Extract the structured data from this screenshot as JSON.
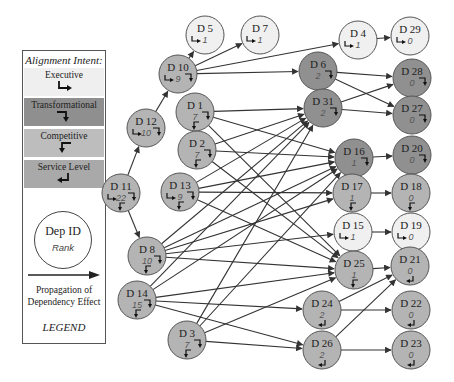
{
  "legend": {
    "title": "Alignment Intent:",
    "intents": [
      {
        "key": "executive",
        "label": "Executive",
        "color": "#efefef",
        "icon": "arrow-down-right-icon"
      },
      {
        "key": "transformational",
        "label": "Transformational",
        "color": "#8f8f8f",
        "icon": "arrow-right-down-icon"
      },
      {
        "key": "competitive",
        "label": "Competitive",
        "color": "#bdbdbd",
        "icon": "arrow-left-down-icon"
      },
      {
        "key": "service",
        "label": "Service Level",
        "color": "#a9a9a9",
        "icon": "arrow-down-left-icon"
      }
    ],
    "node_id_label": "Dep ID",
    "node_rank_label": "Rank",
    "propagation_label_1": "Propagation of",
    "propagation_label_2": "Dependency Effect",
    "footer": "LEGEND"
  },
  "colors": {
    "light": "#f0f0f0",
    "mid": "#b4b4b4",
    "dark": "#909090",
    "edge": "#333333"
  },
  "nodes": [
    {
      "id": "D 5",
      "rank": "1",
      "shade": "light",
      "intents": [
        "executive"
      ]
    },
    {
      "id": "D 7",
      "rank": "1",
      "shade": "light",
      "intents": [
        "executive"
      ]
    },
    {
      "id": "D 10",
      "rank": "9",
      "shade": "mid",
      "intents": [
        "executive",
        "transformational"
      ]
    },
    {
      "id": "D 4",
      "rank": "1",
      "shade": "light",
      "intents": [
        "executive"
      ]
    },
    {
      "id": "D 29",
      "rank": "0",
      "shade": "light",
      "intents": [
        "executive"
      ]
    },
    {
      "id": "D 6",
      "rank": "2",
      "shade": "dark",
      "intents": [
        "transformational"
      ]
    },
    {
      "id": "D 28",
      "rank": "0",
      "shade": "dark",
      "intents": [
        "transformational"
      ]
    },
    {
      "id": "D 1",
      "rank": "7",
      "shade": "mid",
      "intents": [
        "transformational",
        "competitive"
      ]
    },
    {
      "id": "D 31",
      "rank": "2",
      "shade": "dark",
      "intents": [
        "transformational"
      ]
    },
    {
      "id": "D 27",
      "rank": "0",
      "shade": "dark",
      "intents": [
        "transformational"
      ]
    },
    {
      "id": "D 12",
      "rank": "10",
      "shade": "mid",
      "intents": [
        "executive",
        "transformational"
      ]
    },
    {
      "id": "D 2",
      "rank": "7",
      "shade": "mid",
      "intents": [
        "transformational",
        "competitive"
      ]
    },
    {
      "id": "D 16",
      "rank": "1",
      "shade": "dark",
      "intents": [
        "transformational"
      ]
    },
    {
      "id": "D 20",
      "rank": "0",
      "shade": "dark",
      "intents": [
        "transformational"
      ]
    },
    {
      "id": "D 13",
      "rank": "9",
      "shade": "mid",
      "intents": [
        "executive",
        "transformational",
        "competitive"
      ]
    },
    {
      "id": "D 17",
      "rank": "1",
      "shade": "mid",
      "intents": [
        "competitive"
      ]
    },
    {
      "id": "D 18",
      "rank": "0",
      "shade": "mid",
      "intents": [
        "competitive"
      ]
    },
    {
      "id": "D 11",
      "rank": "22",
      "shade": "mid",
      "intents": [
        "executive",
        "transformational",
        "competitive"
      ]
    },
    {
      "id": "D 15",
      "rank": "1",
      "shade": "light",
      "intents": [
        "executive"
      ]
    },
    {
      "id": "D 19",
      "rank": "0",
      "shade": "light",
      "intents": [
        "executive"
      ]
    },
    {
      "id": "D 8",
      "rank": "10",
      "shade": "mid",
      "intents": [
        "transformational",
        "competitive"
      ]
    },
    {
      "id": "D 25",
      "rank": "1",
      "shade": "mid",
      "intents": [
        "competitive"
      ]
    },
    {
      "id": "D 21",
      "rank": "0",
      "shade": "mid",
      "intents": [
        "service"
      ]
    },
    {
      "id": "D 14",
      "rank": "15",
      "shade": "mid",
      "intents": [
        "transformational",
        "competitive"
      ]
    },
    {
      "id": "D 24",
      "rank": "2",
      "shade": "mid",
      "intents": [
        "service"
      ]
    },
    {
      "id": "D 22",
      "rank": "0",
      "shade": "mid",
      "intents": [
        "service"
      ]
    },
    {
      "id": "D 3",
      "rank": "7",
      "shade": "mid",
      "intents": [
        "transformational",
        "competitive"
      ]
    },
    {
      "id": "D 26",
      "rank": "2",
      "shade": "mid",
      "intents": [
        "service"
      ]
    },
    {
      "id": "D 23",
      "rank": "0",
      "shade": "mid",
      "intents": [
        "service"
      ]
    }
  ],
  "edges": [
    [
      "D 11",
      "D 12"
    ],
    [
      "D 11",
      "D 8"
    ],
    [
      "D 12",
      "D 10"
    ],
    [
      "D 10",
      "D 5"
    ],
    [
      "D 10",
      "D 7"
    ],
    [
      "D 10",
      "D 4"
    ],
    [
      "D 10",
      "D 6"
    ],
    [
      "D 4",
      "D 29"
    ],
    [
      "D 6",
      "D 28"
    ],
    [
      "D 6",
      "D 27"
    ],
    [
      "D 31",
      "D 28"
    ],
    [
      "D 31",
      "D 27"
    ],
    [
      "D 16",
      "D 20"
    ],
    [
      "D 17",
      "D 18"
    ],
    [
      "D 15",
      "D 19"
    ],
    [
      "D 25",
      "D 21"
    ],
    [
      "D 24",
      "D 21"
    ],
    [
      "D 24",
      "D 22"
    ],
    [
      "D 26",
      "D 21"
    ],
    [
      "D 26",
      "D 23"
    ],
    [
      "D 1",
      "D 31"
    ],
    [
      "D 1",
      "D 16"
    ],
    [
      "D 1",
      "D 25"
    ],
    [
      "D 2",
      "D 31"
    ],
    [
      "D 2",
      "D 16"
    ],
    [
      "D 2",
      "D 25"
    ],
    [
      "D 13",
      "D 31"
    ],
    [
      "D 13",
      "D 16"
    ],
    [
      "D 13",
      "D 17"
    ],
    [
      "D 13",
      "D 25"
    ],
    [
      "D 8",
      "D 31"
    ],
    [
      "D 8",
      "D 16"
    ],
    [
      "D 8",
      "D 17"
    ],
    [
      "D 8",
      "D 25"
    ],
    [
      "D 8",
      "D 15"
    ],
    [
      "D 14",
      "D 31"
    ],
    [
      "D 14",
      "D 16"
    ],
    [
      "D 14",
      "D 25"
    ],
    [
      "D 14",
      "D 24"
    ],
    [
      "D 14",
      "D 26"
    ],
    [
      "D 3",
      "D 31"
    ],
    [
      "D 3",
      "D 16"
    ],
    [
      "D 3",
      "D 25"
    ],
    [
      "D 3",
      "D 26"
    ]
  ]
}
